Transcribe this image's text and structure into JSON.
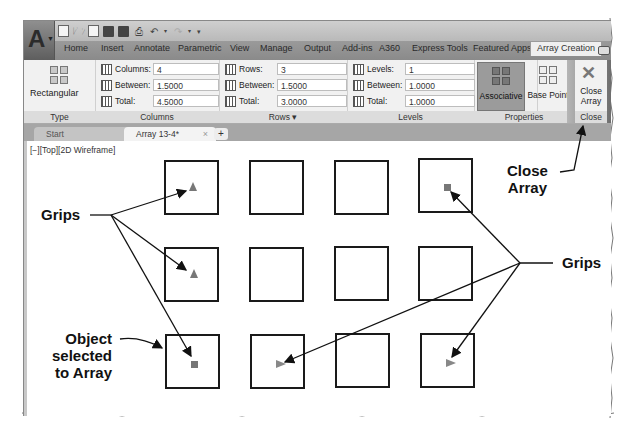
{
  "app": {
    "logo_letter": "A",
    "quick_access_icons": [
      "new-icon",
      "open-icon",
      "open-sheet-set-icon",
      "save-icon",
      "save-as-icon",
      "plot-icon",
      "undo-icon",
      "redo-icon",
      "customize-qat-icon"
    ]
  },
  "ribbon_tabs": [
    {
      "label": "Home"
    },
    {
      "label": "Insert"
    },
    {
      "label": "Annotate"
    },
    {
      "label": "Parametric"
    },
    {
      "label": "View"
    },
    {
      "label": "Manage"
    },
    {
      "label": "Output"
    },
    {
      "label": "Add-ins"
    },
    {
      "label": "A360"
    },
    {
      "label": "Express Tools"
    },
    {
      "label": "Featured Apps"
    },
    {
      "label": "Array Creation",
      "active": true
    }
  ],
  "ribbon": {
    "type": {
      "button_label": "Rectangular",
      "panel_title": "Type"
    },
    "columns": {
      "panel_title": "Columns",
      "fields": [
        {
          "label": "Columns:",
          "value": "4"
        },
        {
          "label": "Between:",
          "value": "1.5000"
        },
        {
          "label": "Total:",
          "value": "4.5000"
        }
      ]
    },
    "rows": {
      "panel_title": "Rows ▾",
      "fields": [
        {
          "label": "Rows:",
          "value": "3"
        },
        {
          "label": "Between:",
          "value": "1.5000"
        },
        {
          "label": "Total:",
          "value": "3.0000"
        }
      ]
    },
    "levels": {
      "panel_title": "Levels",
      "fields": [
        {
          "label": "Levels:",
          "value": "1"
        },
        {
          "label": "Between:",
          "value": "1.0000"
        },
        {
          "label": "Total:",
          "value": "1.0000"
        }
      ]
    },
    "properties": {
      "panel_title": "Properties",
      "associative_label": "Associative",
      "base_point_label": "Base Point"
    },
    "close": {
      "panel_title": "Close",
      "close_array_line1": "Close",
      "close_array_line2": "Array"
    }
  },
  "doc_tabs": {
    "start": "Start",
    "active": "Array 13-4*",
    "close_glyph": "×",
    "new_tab_glyph": "+"
  },
  "viewport": {
    "label": "[−][Top][2D Wireframe]"
  },
  "callouts": {
    "grips_left": "Grips",
    "grips_right": "Grips",
    "close_array_line1": "Close",
    "close_array_line2": "Array",
    "object_line1": "Object",
    "object_line2": "selected",
    "object_line3": "to Array"
  },
  "array_grid": {
    "columns": 4,
    "rows": 3
  }
}
